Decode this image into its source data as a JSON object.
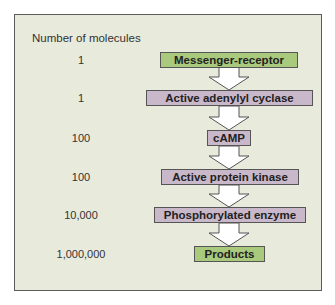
{
  "diagram": {
    "column_title": "Number of molecules",
    "colors": {
      "green": "#a9c97d",
      "purple": "#c9b8c9",
      "panel": "#e8eadc"
    },
    "steps": [
      {
        "count": "1",
        "label": "Messenger-receptor",
        "color": "green"
      },
      {
        "count": "1",
        "label": "Active adenylyl cyclase",
        "color": "purple"
      },
      {
        "count": "100",
        "label": "cAMP",
        "color": "purple"
      },
      {
        "count": "100",
        "label": "Active protein kinase",
        "color": "purple"
      },
      {
        "count": "10,000",
        "label": "Phosphorylated enzyme",
        "color": "purple"
      },
      {
        "count": "1,000,000",
        "label": "Products",
        "color": "green"
      }
    ]
  }
}
